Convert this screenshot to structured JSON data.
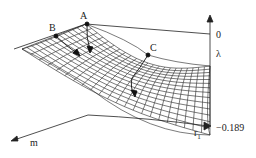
{
  "diagram": {
    "type": "3d-surface-plot",
    "points": [
      {
        "label": "A"
      },
      {
        "label": "B"
      },
      {
        "label": "C"
      }
    ],
    "axes": {
      "vertical": {
        "label": "λ",
        "top_tick": "0",
        "bottom_tick": "−0.189"
      },
      "depth": {
        "label": "m"
      },
      "horizontal": {
        "label": "r",
        "subscript": "1"
      }
    }
  }
}
